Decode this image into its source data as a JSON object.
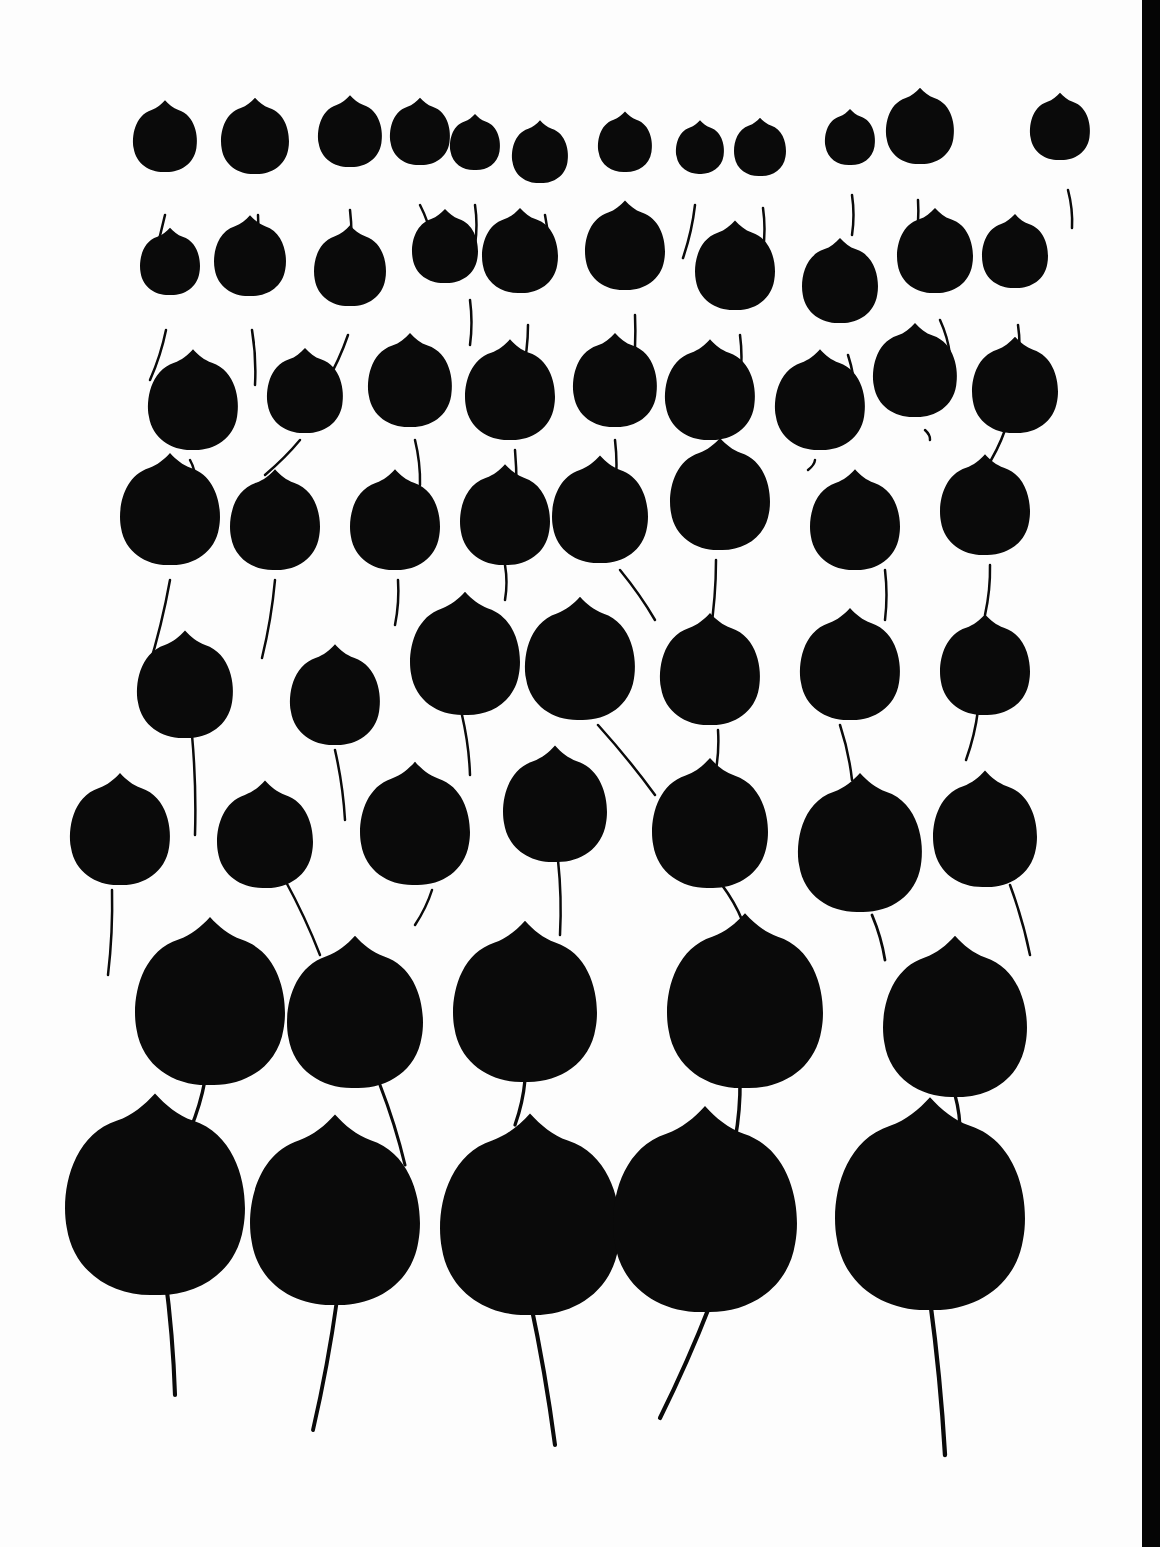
{
  "artwork": {
    "title": "",
    "background": "#fdfdfd",
    "ink": "#0a0a0a",
    "right_edge_band": "#050505"
  },
  "leaves": [
    {
      "x": 165,
      "y": 140,
      "r": 32,
      "sx": 165,
      "sy": 215,
      "sx2": 148,
      "sy2": 270
    },
    {
      "x": 255,
      "y": 140,
      "r": 34,
      "sx": 258,
      "sy": 215,
      "sx2": 255,
      "sy2": 282
    },
    {
      "x": 350,
      "y": 135,
      "r": 32,
      "sx": 350,
      "sy": 210,
      "sx2": 350,
      "sy2": 260
    },
    {
      "x": 420,
      "y": 135,
      "r": 30,
      "sx": 420,
      "sy": 205,
      "sx2": 432,
      "sy2": 240
    },
    {
      "x": 475,
      "y": 145,
      "r": 25,
      "sx": 475,
      "sy": 205,
      "sx2": 475,
      "sy2": 245
    },
    {
      "x": 540,
      "y": 155,
      "r": 28,
      "sx": 545,
      "sy": 215,
      "sx2": 548,
      "sy2": 255
    },
    {
      "x": 625,
      "y": 145,
      "r": 27,
      "sx": 623,
      "sy": 205,
      "sx2": 622,
      "sy2": 240
    },
    {
      "x": 700,
      "y": 150,
      "r": 24,
      "sx": 695,
      "sy": 205,
      "sx2": 683,
      "sy2": 258
    },
    {
      "x": 760,
      "y": 150,
      "r": 26,
      "sx": 763,
      "sy": 208,
      "sx2": 763,
      "sy2": 250
    },
    {
      "x": 850,
      "y": 140,
      "r": 25,
      "sx": 852,
      "sy": 195,
      "sx2": 852,
      "sy2": 235
    },
    {
      "x": 920,
      "y": 130,
      "r": 34,
      "sx": 918,
      "sy": 200,
      "sx2": 915,
      "sy2": 245
    },
    {
      "x": 1060,
      "y": 130,
      "r": 30,
      "sx": 1068,
      "sy": 190,
      "sx2": 1072,
      "sy2": 228
    },
    {
      "x": 170,
      "y": 265,
      "r": 30,
      "sx": 166,
      "sy": 330,
      "sx2": 150,
      "sy2": 380
    },
    {
      "x": 250,
      "y": 260,
      "r": 36,
      "sx": 252,
      "sy": 330,
      "sx2": 255,
      "sy2": 385
    },
    {
      "x": 350,
      "y": 270,
      "r": 36,
      "sx": 348,
      "sy": 335,
      "sx2": 325,
      "sy2": 385
    },
    {
      "x": 445,
      "y": 250,
      "r": 33,
      "sx": 470,
      "sy": 300,
      "sx2": 470,
      "sy2": 345
    },
    {
      "x": 520,
      "y": 255,
      "r": 38,
      "sx": 528,
      "sy": 325,
      "sx2": 522,
      "sy2": 375
    },
    {
      "x": 625,
      "y": 250,
      "r": 40,
      "sx": 635,
      "sy": 315,
      "sx2": 632,
      "sy2": 380
    },
    {
      "x": 735,
      "y": 270,
      "r": 40,
      "sx": 740,
      "sy": 335,
      "sx2": 740,
      "sy2": 380
    },
    {
      "x": 840,
      "y": 285,
      "r": 38,
      "sx": 848,
      "sy": 355,
      "sx2": 855,
      "sy2": 395
    },
    {
      "x": 935,
      "y": 255,
      "r": 38,
      "sx": 940,
      "sy": 320,
      "sx2": 950,
      "sy2": 355
    },
    {
      "x": 1015,
      "y": 255,
      "r": 33,
      "sx": 1018,
      "sy": 325,
      "sx2": 1018,
      "sy2": 365
    },
    {
      "x": 193,
      "y": 405,
      "r": 45,
      "sx": 190,
      "sy": 460,
      "sx2": 195,
      "sy2": 480
    },
    {
      "x": 305,
      "y": 395,
      "r": 38,
      "sx": 300,
      "sy": 440,
      "sx2": 265,
      "sy2": 475
    },
    {
      "x": 410,
      "y": 385,
      "r": 42,
      "sx": 415,
      "sy": 440,
      "sx2": 420,
      "sy2": 485
    },
    {
      "x": 510,
      "y": 395,
      "r": 45,
      "sx": 515,
      "sy": 450,
      "sx2": 515,
      "sy2": 520
    },
    {
      "x": 615,
      "y": 385,
      "r": 42,
      "sx": 615,
      "sy": 440,
      "sx2": 615,
      "sy2": 490
    },
    {
      "x": 710,
      "y": 395,
      "r": 45,
      "sx": 710,
      "sy": 455,
      "sx2": 707,
      "sy2": 485
    },
    {
      "x": 820,
      "y": 405,
      "r": 45,
      "sx": 815,
      "sy": 460,
      "sx2": 808,
      "sy2": 470
    },
    {
      "x": 915,
      "y": 375,
      "r": 42,
      "sx": 925,
      "sy": 430,
      "sx2": 930,
      "sy2": 440
    },
    {
      "x": 1015,
      "y": 390,
      "r": 43,
      "sx": 1005,
      "sy": 430,
      "sx2": 985,
      "sy2": 470
    },
    {
      "x": 170,
      "y": 515,
      "r": 50,
      "sx": 170,
      "sy": 580,
      "sx2": 148,
      "sy2": 670
    },
    {
      "x": 275,
      "y": 525,
      "r": 45,
      "sx": 275,
      "sy": 580,
      "sx2": 262,
      "sy2": 658
    },
    {
      "x": 395,
      "y": 525,
      "r": 45,
      "sx": 398,
      "sy": 580,
      "sx2": 395,
      "sy2": 625
    },
    {
      "x": 505,
      "y": 520,
      "r": 45,
      "sx": 505,
      "sy": 565,
      "sx2": 505,
      "sy2": 600
    },
    {
      "x": 600,
      "y": 515,
      "r": 48,
      "sx": 620,
      "sy": 570,
      "sx2": 655,
      "sy2": 620
    },
    {
      "x": 720,
      "y": 500,
      "r": 50,
      "sx": 716,
      "sy": 560,
      "sx2": 710,
      "sy2": 635
    },
    {
      "x": 855,
      "y": 525,
      "r": 45,
      "sx": 885,
      "sy": 570,
      "sx2": 885,
      "sy2": 620
    },
    {
      "x": 985,
      "y": 510,
      "r": 45,
      "sx": 990,
      "sy": 565,
      "sx2": 985,
      "sy2": 615
    },
    {
      "x": 185,
      "y": 690,
      "r": 48,
      "sx": 192,
      "sy": 735,
      "sx2": 195,
      "sy2": 835
    },
    {
      "x": 335,
      "y": 700,
      "r": 45,
      "sx": 335,
      "sy": 750,
      "sx2": 345,
      "sy2": 820
    },
    {
      "x": 465,
      "y": 660,
      "r": 55,
      "sx": 462,
      "sy": 715,
      "sx2": 470,
      "sy2": 775
    },
    {
      "x": 580,
      "y": 665,
      "r": 55,
      "sx": 598,
      "sy": 725,
      "sx2": 655,
      "sy2": 795
    },
    {
      "x": 710,
      "y": 675,
      "r": 50,
      "sx": 718,
      "sy": 730,
      "sx2": 715,
      "sy2": 775
    },
    {
      "x": 850,
      "y": 670,
      "r": 50,
      "sx": 840,
      "sy": 725,
      "sx2": 852,
      "sy2": 780
    },
    {
      "x": 985,
      "y": 670,
      "r": 45,
      "sx": 978,
      "sy": 710,
      "sx2": 966,
      "sy2": 760
    },
    {
      "x": 120,
      "y": 835,
      "r": 50,
      "sx": 112,
      "sy": 890,
      "sx2": 108,
      "sy2": 975
    },
    {
      "x": 265,
      "y": 840,
      "r": 48,
      "sx": 285,
      "sy": 880,
      "sx2": 320,
      "sy2": 955
    },
    {
      "x": 415,
      "y": 830,
      "r": 55,
      "sx": 432,
      "sy": 890,
      "sx2": 415,
      "sy2": 925
    },
    {
      "x": 555,
      "y": 810,
      "r": 52,
      "sx": 558,
      "sy": 860,
      "sx2": 560,
      "sy2": 935
    },
    {
      "x": 710,
      "y": 830,
      "r": 58,
      "sx": 722,
      "sy": 885,
      "sx2": 742,
      "sy2": 920
    },
    {
      "x": 860,
      "y": 850,
      "r": 62,
      "sx": 872,
      "sy": 915,
      "sx2": 885,
      "sy2": 960
    },
    {
      "x": 985,
      "y": 835,
      "r": 52,
      "sx": 1010,
      "sy": 885,
      "sx2": 1030,
      "sy2": 955
    },
    {
      "x": 210,
      "y": 1010,
      "r": 75,
      "sx": 205,
      "sy": 1080,
      "sx2": 190,
      "sy2": 1130
    },
    {
      "x": 355,
      "y": 1020,
      "r": 68,
      "sx": 380,
      "sy": 1085,
      "sx2": 405,
      "sy2": 1165
    },
    {
      "x": 525,
      "y": 1010,
      "r": 72,
      "sx": 525,
      "sy": 1080,
      "sx2": 515,
      "sy2": 1125
    },
    {
      "x": 745,
      "y": 1010,
      "r": 78,
      "sx": 740,
      "sy": 1080,
      "sx2": 735,
      "sy2": 1140
    },
    {
      "x": 955,
      "y": 1025,
      "r": 72,
      "sx": 955,
      "sy": 1095,
      "sx2": 960,
      "sy2": 1135
    },
    {
      "x": 155,
      "y": 1205,
      "r": 90,
      "sx": 165,
      "sy": 1275,
      "sx2": 175,
      "sy2": 1395
    },
    {
      "x": 335,
      "y": 1220,
      "r": 85,
      "sx": 337,
      "sy": 1300,
      "sx2": 313,
      "sy2": 1430
    },
    {
      "x": 530,
      "y": 1225,
      "r": 90,
      "sx": 530,
      "sy": 1300,
      "sx2": 555,
      "sy2": 1445
    },
    {
      "x": 705,
      "y": 1220,
      "r": 92,
      "sx": 710,
      "sy": 1305,
      "sx2": 660,
      "sy2": 1418
    },
    {
      "x": 930,
      "y": 1215,
      "r": 95,
      "sx": 930,
      "sy": 1300,
      "sx2": 945,
      "sy2": 1455
    }
  ]
}
